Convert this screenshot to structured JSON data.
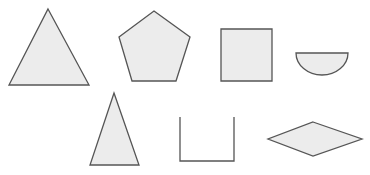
{
  "diagram": {
    "title": "",
    "fill": "#ececec",
    "stroke": "#555555",
    "shapes": [
      {
        "name": "triangle-equilateral",
        "type": "polygon",
        "points": "48,9 89,85 9,85"
      },
      {
        "name": "pentagon",
        "type": "polygon",
        "points": "154,11 190,37 176,81 132,81 119,37"
      },
      {
        "name": "square",
        "type": "polygon",
        "points": "221,29 272,29 272,81 221,81"
      },
      {
        "name": "semicircle",
        "type": "path",
        "d": "M296,53 L348,53 A26,22 0 0 1 296,53 Z"
      },
      {
        "name": "triangle-isosceles",
        "type": "polygon",
        "points": "114,93 139,165 90,165"
      },
      {
        "name": "open-box",
        "type": "polyline",
        "points": "180,117 180,161 234,161 234,117"
      },
      {
        "name": "rhombus",
        "type": "polygon",
        "points": "313,122 362,139 313,156 268,139"
      }
    ]
  }
}
